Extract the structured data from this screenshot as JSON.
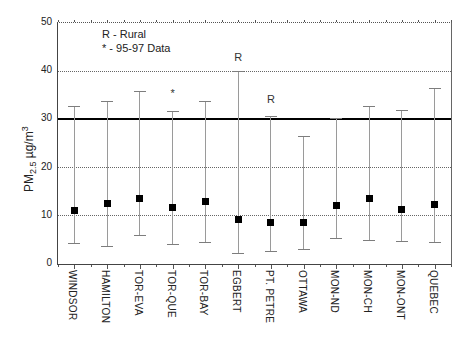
{
  "chart_data": {
    "type": "scatter",
    "title": "",
    "ylabel": "PM2.5 µg/m³",
    "ylabel_parts": {
      "base": "PM",
      "sub": "2.5",
      "units": "  µg/m",
      "sup": "3"
    },
    "ylim": [
      0,
      50
    ],
    "yticks": [
      0,
      10,
      20,
      30,
      40,
      50
    ],
    "grid": "horizontal dotted gridlines at 10, 20, 30, 40, 50",
    "reference_line": {
      "value": 30,
      "style": "solid",
      "color": "#000000"
    },
    "legend": {
      "position": "top-left-inside",
      "entries": [
        "R - Rural",
        "* - 95-97 Data"
      ]
    },
    "categories": [
      "WINDSOR",
      "HAMILTON",
      "TOR-EVA",
      "TOR-QUE",
      "TOR-BAY",
      "EGBERT",
      "PT. PETRE",
      "OTTAWA",
      "MON-ND",
      "MON-CH",
      "MON-ONT",
      "QUEBEC"
    ],
    "series": [
      {
        "name": "mean (filled square)",
        "values": [
          11.1,
          12.6,
          13.6,
          11.8,
          12.9,
          9.3,
          8.7,
          8.7,
          12.2,
          13.5,
          11.4,
          12.3
        ]
      },
      {
        "name": "lower bound",
        "values": [
          4.2,
          3.6,
          6.0,
          4.1,
          4.4,
          2.2,
          2.5,
          3.0,
          5.2,
          4.8,
          4.6,
          4.4
        ]
      },
      {
        "name": "upper bound",
        "values": [
          32.7,
          33.8,
          35.8,
          31.7,
          33.8,
          40.0,
          30.5,
          26.4,
          30.2,
          32.6,
          31.9,
          36.4
        ]
      }
    ],
    "annotations": [
      {
        "category": "TOR-QUE",
        "text": "*",
        "y": 35.2
      },
      {
        "category": "EGBERT",
        "text": "R",
        "y": 42.8
      },
      {
        "category": "PT. PETRE",
        "text": "R",
        "y": 34.0
      }
    ],
    "colors": {
      "marker": "#000000",
      "error_bar": "#9a9a9a",
      "error_cap": "#7d7d7d",
      "grid": "#666666",
      "reference": "#000000",
      "background": "#ffffff"
    }
  }
}
